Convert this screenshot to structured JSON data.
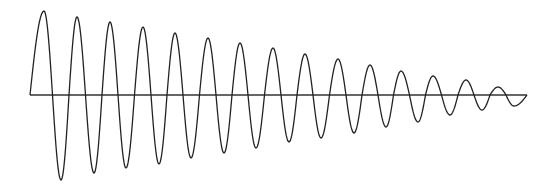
{
  "chart_data": {
    "type": "line",
    "title": "",
    "xlabel": "",
    "ylabel": "",
    "grid": false,
    "legend": null,
    "axis": {
      "x_start_px": 30,
      "x_end_px": 527,
      "y_px": 95
    },
    "wave": {
      "start_x_px": 30,
      "end_x_px": 527,
      "period_px": 32.6,
      "phase_start": "zero-crossing rising",
      "initial_amplitude_px": 86,
      "final_amplitude_px": 8
    },
    "peaks": [
      {
        "x": 44,
        "y_px": 11
      },
      {
        "x": 77,
        "y_px": 17
      },
      {
        "x": 110,
        "y_px": 22
      },
      {
        "x": 143,
        "y_px": 27
      },
      {
        "x": 175,
        "y_px": 33
      },
      {
        "x": 208,
        "y_px": 38
      },
      {
        "x": 240,
        "y_px": 43
      },
      {
        "x": 273,
        "y_px": 48
      },
      {
        "x": 305,
        "y_px": 54
      },
      {
        "x": 338,
        "y_px": 59
      },
      {
        "x": 370,
        "y_px": 65
      },
      {
        "x": 401,
        "y_px": 71
      },
      {
        "x": 433,
        "y_px": 76
      },
      {
        "x": 466,
        "y_px": 80
      },
      {
        "x": 498,
        "y_px": 87
      }
    ],
    "troughs": [
      {
        "x": 61,
        "y_px": 180
      },
      {
        "x": 94,
        "y_px": 173
      },
      {
        "x": 126,
        "y_px": 168
      },
      {
        "x": 159,
        "y_px": 164
      },
      {
        "x": 191,
        "y_px": 158
      },
      {
        "x": 224,
        "y_px": 153
      },
      {
        "x": 256,
        "y_px": 148
      },
      {
        "x": 289,
        "y_px": 142
      },
      {
        "x": 321,
        "y_px": 138
      },
      {
        "x": 354,
        "y_px": 133
      },
      {
        "x": 386,
        "y_px": 127
      },
      {
        "x": 418,
        "y_px": 122
      },
      {
        "x": 450,
        "y_px": 115
      },
      {
        "x": 482,
        "y_px": 110
      },
      {
        "x": 514,
        "y_px": 106
      }
    ]
  },
  "style": {
    "line_color": "#222222",
    "axis_color": "#333333",
    "background": "#ffffff"
  }
}
